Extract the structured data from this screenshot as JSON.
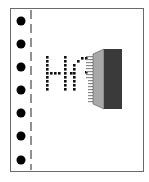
{
  "icon": {
    "name": "dot-matrix-printer-icon",
    "printed_text": "Hi",
    "colors": {
      "paper_border": "#6a6a6a",
      "holes": "#000000",
      "dots": "#111111",
      "head_face": "#a8a8a8",
      "head_body": "#3a3a3a",
      "pins": "#8a8a8a"
    },
    "tractor_holes": 7
  }
}
